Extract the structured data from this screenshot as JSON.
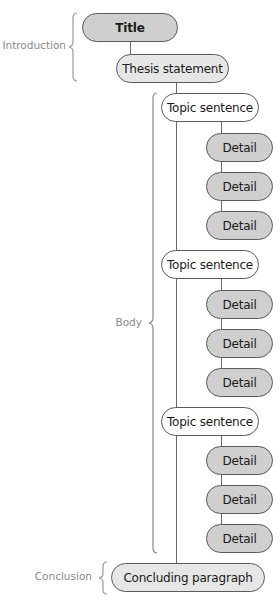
{
  "sections": {
    "introduction": "Introduction",
    "body": "Body",
    "conclusion": "Conclusion"
  },
  "nodes": {
    "title": "Title",
    "thesis": "Thesis statement",
    "paragraphs": [
      {
        "topic": "Topic sentence",
        "details": [
          "Detail",
          "Detail",
          "Detail"
        ]
      },
      {
        "topic": "Topic sentence",
        "details": [
          "Detail",
          "Detail",
          "Detail"
        ]
      },
      {
        "topic": "Topic sentence",
        "details": [
          "Detail",
          "Detail",
          "Detail"
        ]
      }
    ],
    "conclusion": "Concluding paragraph"
  },
  "colors": {
    "title_fill": "#cfcfcf",
    "thesis_fill": "#e6e6e6",
    "topic_fill": "#ffffff",
    "detail_fill": "#cfcfcf",
    "conclusion_fill": "#e6e6e6",
    "label_color": "#8a8a8a"
  }
}
